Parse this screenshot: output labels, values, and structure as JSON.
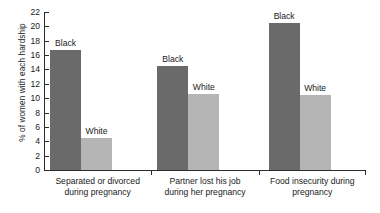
{
  "chart_data": {
    "type": "bar",
    "title": "",
    "subtitle": "",
    "xlabel": "",
    "ylabel": "% of women with each hardship",
    "ylim": [
      0,
      22
    ],
    "ytick_step": 2,
    "yticks": [
      0,
      2,
      4,
      6,
      8,
      10,
      12,
      14,
      16,
      18,
      20,
      22
    ],
    "ytick_labels": [
      "0",
      "2",
      "4",
      "6",
      "8",
      "10",
      "12",
      "14",
      "16",
      "18",
      "20",
      "22"
    ],
    "grid": false,
    "legend_position": "none",
    "categories": [
      "Separated or divorced during pregnancy",
      "Partner lost his job during her pregnancy",
      "Food insecurity during pregnancy"
    ],
    "category_lines": [
      [
        "Separated or divorced",
        "during pregnancy"
      ],
      [
        "Partner lost his job",
        "during her pregnancy"
      ],
      [
        "Food insecurity during",
        "pregnancy"
      ]
    ],
    "series": [
      {
        "name": "Black",
        "color": "#6a6a6a",
        "values": [
          16.7,
          14.5,
          20.5
        ]
      },
      {
        "name": "White",
        "color": "#b5b5b5",
        "values": [
          4.4,
          10.6,
          10.5
        ]
      }
    ],
    "bar_annotations": [
      {
        "group": 0,
        "series": "Black",
        "label": "Black"
      },
      {
        "group": 0,
        "series": "White",
        "label": "White"
      },
      {
        "group": 1,
        "series": "Black",
        "label": "Black"
      },
      {
        "group": 1,
        "series": "White",
        "label": "White"
      },
      {
        "group": 2,
        "series": "Black",
        "label": "Black"
      },
      {
        "group": 2,
        "series": "White",
        "label": "White"
      }
    ],
    "axis_color": "#2b2b2b",
    "background_color": "#ffffff"
  }
}
